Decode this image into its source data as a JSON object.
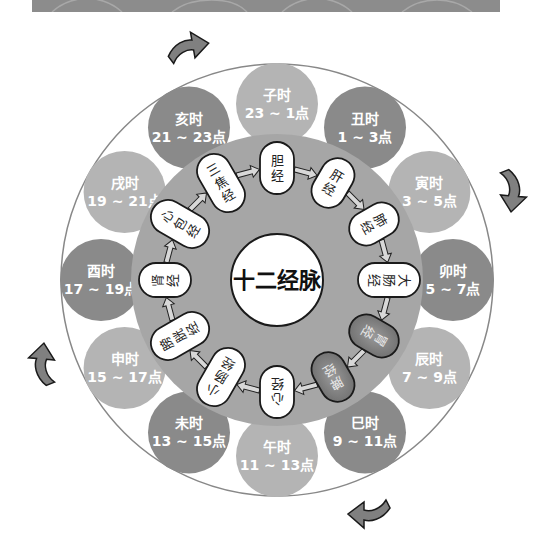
{
  "diagram": {
    "title": "十二经脉",
    "center": {
      "x": 277,
      "y": 280
    },
    "outer_ring_radius": 216,
    "inner_disk_radius": 146,
    "center_circle_radius": 46,
    "colors": {
      "banner": "#8c8c8c",
      "outer_ring_stroke": "#888888",
      "inner_disk": "#a6a6a6",
      "hour_dark": "#8a8a8a",
      "hour_light": "#b4b4b4",
      "pill_fill": "#ffffff",
      "pill_dark": "#6e6e6e",
      "pill_stroke": "#1a1a1a",
      "arrow_fill": "#808080"
    },
    "hours": [
      {
        "name": "子时",
        "range": "23 ~ 1点",
        "tone": "light"
      },
      {
        "name": "丑时",
        "range": "1 ~ 3点",
        "tone": "dark"
      },
      {
        "name": "寅时",
        "range": "3 ~ 5点",
        "tone": "light"
      },
      {
        "name": "卯时",
        "range": "5 ~ 7点",
        "tone": "dark"
      },
      {
        "name": "辰时",
        "range": "7 ~ 9点",
        "tone": "light"
      },
      {
        "name": "巳时",
        "range": "9 ~ 11点",
        "tone": "dark"
      },
      {
        "name": "午时",
        "range": "11 ~ 13点",
        "tone": "light"
      },
      {
        "name": "未时",
        "range": "13 ~ 15点",
        "tone": "dark"
      },
      {
        "name": "申时",
        "range": "15 ~ 17点",
        "tone": "light"
      },
      {
        "name": "酉时",
        "range": "17 ~ 19点",
        "tone": "dark"
      },
      {
        "name": "戌时",
        "range": "19 ~ 21点",
        "tone": "light"
      },
      {
        "name": "亥时",
        "range": "21 ~ 23点",
        "tone": "dark"
      }
    ],
    "meridians": [
      {
        "label": "胆经",
        "highlighted": false
      },
      {
        "label": "肝经",
        "highlighted": false
      },
      {
        "label": "肺经",
        "highlighted": false
      },
      {
        "label": "大肠经",
        "highlighted": false
      },
      {
        "label": "胃经",
        "highlighted": true
      },
      {
        "label": "脾经",
        "highlighted": true
      },
      {
        "label": "心经",
        "highlighted": false
      },
      {
        "label": "小肠经",
        "highlighted": false
      },
      {
        "label": "膀胱经",
        "highlighted": false
      },
      {
        "label": "肾经",
        "highlighted": false
      },
      {
        "label": "心包经",
        "highlighted": false
      },
      {
        "label": "三焦经",
        "highlighted": false
      }
    ],
    "rotation_arrows": [
      {
        "position": "top-left",
        "direction": "clockwise"
      },
      {
        "position": "right",
        "direction": "clockwise"
      },
      {
        "position": "bottom-right",
        "direction": "clockwise"
      },
      {
        "position": "left",
        "direction": "clockwise"
      }
    ]
  }
}
